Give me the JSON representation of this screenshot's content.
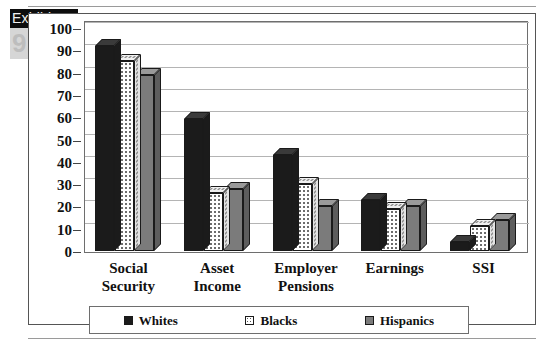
{
  "exhibit": {
    "label": "Exhibit",
    "number": "9.1"
  },
  "chart_data": {
    "type": "bar",
    "title": "",
    "xlabel": "",
    "ylabel": "",
    "ylim": [
      0,
      100
    ],
    "ytick_step": 10,
    "yticks": [
      "100",
      "90",
      "80",
      "70",
      "60",
      "50",
      "40",
      "30",
      "20",
      "10",
      "0"
    ],
    "grid": true,
    "legend_position": "bottom",
    "categories": [
      "Social Security",
      "Asset Income",
      "Employer Pensions",
      "Earnings",
      "SSI"
    ],
    "category_lines": [
      [
        "Social",
        "Security"
      ],
      [
        "Asset",
        "Income"
      ],
      [
        "Employer",
        "Pensions"
      ],
      [
        "Earnings",
        ""
      ],
      [
        "SSI",
        ""
      ]
    ],
    "series": [
      {
        "name": "Whites",
        "key": "whites",
        "color": "#1b1b1b",
        "values": [
          92,
          59,
          43,
          23,
          4
        ]
      },
      {
        "name": "Blacks",
        "key": "blacks",
        "color": "#ffffff",
        "values": [
          85,
          26,
          30,
          19,
          11
        ]
      },
      {
        "name": "Hispanics",
        "key": "hispanics",
        "color": "#7b7b7b",
        "values": [
          79,
          28,
          20,
          20,
          14
        ]
      }
    ]
  },
  "legend": {
    "items": [
      {
        "label": "Whites",
        "swatch": "black-square-icon"
      },
      {
        "label": "Blacks",
        "swatch": "dotted-square-icon"
      },
      {
        "label": "Hispanics",
        "swatch": "gray-square-icon"
      }
    ]
  }
}
